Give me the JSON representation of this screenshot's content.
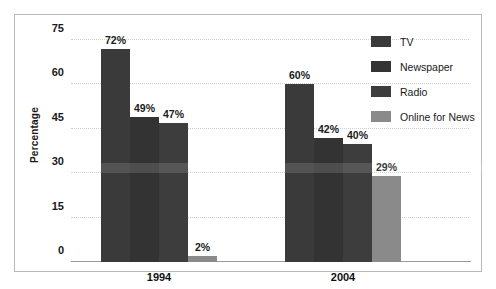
{
  "chart_data": {
    "type": "bar",
    "title": "",
    "subtitle": "",
    "xlabel": "",
    "ylabel": "Percentage",
    "categories": [
      "1994",
      "2004"
    ],
    "ylim": [
      0,
      78
    ],
    "yticks": [
      0,
      15,
      30,
      45,
      60,
      75
    ],
    "ytick_labels": [
      "0",
      "15",
      "30",
      "45",
      "60",
      "75"
    ],
    "grid": true,
    "grid_axis": "y",
    "legend_position": "top-right",
    "value_suffix": "%",
    "series": [
      {
        "name": "TV",
        "color": "#3a3a3a",
        "values": [
          72,
          60
        ],
        "labels": [
          "72%",
          "60%"
        ]
      },
      {
        "name": "Newspaper",
        "color": "#333333",
        "values": [
          49,
          42
        ],
        "labels": [
          "49%",
          "42%"
        ]
      },
      {
        "name": "Radio",
        "color": "#3d3d3d",
        "values": [
          47,
          40
        ],
        "labels": [
          "47%",
          "40%"
        ]
      },
      {
        "name": "Online for News",
        "color": "#8a8a8a",
        "values": [
          2,
          29
        ],
        "labels": [
          "2%",
          "29%"
        ]
      }
    ]
  },
  "legend": {
    "items": [
      {
        "label": "TV"
      },
      {
        "label": "Newspaper"
      },
      {
        "label": "Radio"
      },
      {
        "label": "Online for News"
      }
    ]
  }
}
